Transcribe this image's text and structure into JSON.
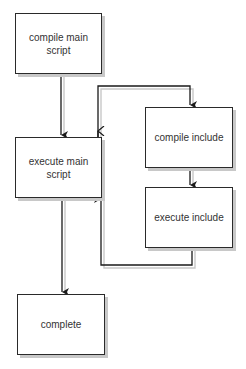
{
  "diagram": {
    "type": "flowchart",
    "nodes": [
      {
        "id": "compile_main",
        "label": "compile main script"
      },
      {
        "id": "execute_main",
        "label": "execute main script"
      },
      {
        "id": "compile_include",
        "label": "compile include"
      },
      {
        "id": "execute_include",
        "label": "execute include"
      },
      {
        "id": "complete",
        "label": "complete"
      }
    ],
    "edges": [
      {
        "from": "compile_main",
        "to": "execute_main"
      },
      {
        "from": "execute_main",
        "to": "compile_include"
      },
      {
        "from": "compile_include",
        "to": "execute_include"
      },
      {
        "from": "execute_include",
        "to": "execute_main"
      },
      {
        "from": "execute_main",
        "to": "complete"
      }
    ],
    "colors": {
      "stroke": "#2a2a2a",
      "shadow": "#c8c8c8",
      "background": "#ffffff",
      "text": "#333333"
    }
  }
}
